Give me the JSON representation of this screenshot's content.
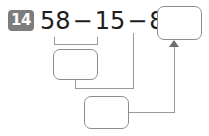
{
  "worksheet": {
    "problem_number": "14",
    "equation": {
      "operand_1": "58",
      "operator_1": "−",
      "operand_2": "15",
      "operator_2": "−",
      "operand_3": "8",
      "equals": "="
    },
    "answer_boxes": [
      {
        "id": "top",
        "value": "",
        "role": "final-answer"
      },
      {
        "id": "middle",
        "value": "",
        "role": "partial-58-minus-15"
      },
      {
        "id": "bottom",
        "value": "",
        "role": "partial-minus-8"
      }
    ],
    "connectors": [
      {
        "id": "bracket",
        "from": "58-minus-15",
        "to": "answer-box-middle"
      },
      {
        "id": "drop-from-eight",
        "from": "operand-8",
        "to": "answer-box-bottom-row"
      },
      {
        "id": "mid-to-bottom",
        "from": "answer-box-middle",
        "to": "answer-box-bottom"
      },
      {
        "id": "bottom-to-top",
        "from": "answer-box-bottom",
        "to": "answer-box-top",
        "arrow": true
      }
    ],
    "colors": {
      "badge_bg": "#7d7d7d",
      "badge_text": "#ffffff",
      "equation_text": "#1e1e1e",
      "box_border": "#8d8d8d",
      "connector": "#9a9a9a",
      "arrow": "#6e6e6e",
      "page_bg": "#ffffff"
    }
  }
}
